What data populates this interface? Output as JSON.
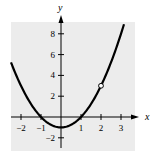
{
  "chart_data": {
    "type": "line",
    "title": "",
    "xlabel": "x",
    "ylabel": "y",
    "function": "y = x^2 - 1",
    "xlim": [
      -2.5,
      3.7
    ],
    "ylim": [
      -3,
      9.3
    ],
    "x_ticks": [
      -2,
      -1,
      1,
      2,
      3
    ],
    "x_tick_labels": [
      "−2",
      "−1",
      "1",
      "2",
      "3"
    ],
    "y_ticks": [
      -2,
      2,
      4,
      6,
      8
    ],
    "y_tick_labels": [
      "−2",
      "2",
      "4",
      "6",
      "8"
    ],
    "grid": false,
    "background": "#ececec",
    "series": [
      {
        "name": "y = x^2 - 1",
        "x": [
          -2.5,
          -2,
          -1.5,
          -1,
          -0.5,
          0,
          0.5,
          1,
          1.5,
          2,
          2.5,
          3,
          3.15
        ],
        "y": [
          5.25,
          3,
          1.25,
          0,
          -0.75,
          -1,
          -0.75,
          0,
          1.25,
          3,
          5.25,
          8,
          8.92
        ],
        "color": "#000000"
      }
    ],
    "annotations": [
      {
        "type": "open-circle",
        "x": 2,
        "y": 3
      }
    ]
  }
}
